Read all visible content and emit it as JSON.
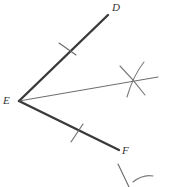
{
  "figure": {
    "name": "angle-bisector-construction",
    "background_color": "#ffffff",
    "stroke_color_rays": "#3a3a3a",
    "stroke_color_thin": "#5a5a5a",
    "label_color": "#333333",
    "vertex_label": "E",
    "ray_labels": {
      "upper": "D",
      "lower": "F"
    },
    "points": {
      "E": [
        19,
        101
      ],
      "D": [
        108,
        15
      ],
      "F": [
        119,
        150
      ]
    },
    "bisector": {
      "from": [
        19,
        101
      ],
      "to": [
        158,
        77
      ]
    },
    "tick_marks": [
      {
        "name": "tick-on-ED",
        "center": [
          67,
          47
        ]
      },
      {
        "name": "tick-on-EF",
        "center": [
          78,
          133
        ]
      }
    ],
    "arc_intersection": {
      "name": "compass-arc-crossing",
      "center": [
        134,
        80
      ]
    },
    "stray_marks": [
      {
        "name": "stray-stroke-lower-right",
        "from": [
          118,
          164
        ],
        "to": [
          129,
          187
        ]
      },
      {
        "name": "stray-arc-lower-right",
        "from": [
          134,
          181
        ],
        "to": [
          152,
          176
        ]
      }
    ]
  }
}
